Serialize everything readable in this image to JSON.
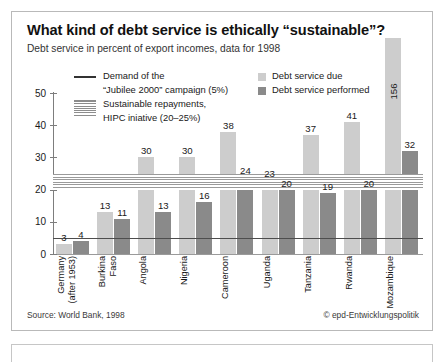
{
  "header": {
    "title": "What kind of debt service is ethically “sustainable”?",
    "subtitle": "Debt service in percent of export incomes, data for 1998"
  },
  "legend": {
    "jubilee_line_1": "Demand of the",
    "jubilee_line_2": "“Jubilee 2000” campaign (5%)",
    "hipc_line_1": "Sustainable repayments,",
    "hipc_line_2": "HIPC iniative (20–25%)",
    "due_label": "Debt service due",
    "performed_label": "Debt service performed"
  },
  "footer": {
    "source": "Source: World Bank, 1998",
    "credit": "© epd-Entwicklungspolitik"
  },
  "colors": {
    "due": "#cdcdcd",
    "performed": "#8a8a8a",
    "axis": "#7d7d7d",
    "jubilee_line": "#4d4d4d",
    "hipc_band": "#9a9a9a"
  },
  "chart_data": {
    "type": "bar",
    "title": "What kind of debt service is ethically “sustainable”?",
    "subtitle": "Debt service in percent of export incomes, data for 1998",
    "xlabel": "",
    "ylabel": "",
    "ylim": [
      0,
      50
    ],
    "yticks": [
      0,
      10,
      20,
      30,
      40,
      50
    ],
    "ytick_labels": [
      "0",
      "10",
      "20",
      "30",
      "40",
      "50"
    ],
    "grid": false,
    "legend_position": "top",
    "categories": [
      "Germany\n(after 1953)",
      "Burkina\nFaso",
      "Angola",
      "Nigeria",
      "Cameroon",
      "Uganda",
      "Tanzania",
      "Rwanda",
      "Mozambique"
    ],
    "series": [
      {
        "name": "Debt service due",
        "color": "#cdcdcd",
        "values": [
          3,
          13,
          30,
          30,
          38,
          23,
          37,
          41,
          156
        ]
      },
      {
        "name": "Debt service performed",
        "color": "#8a8a8a",
        "values": [
          4,
          11,
          13,
          16,
          24,
          20,
          19,
          20,
          32
        ]
      }
    ],
    "reference_lines": [
      {
        "name": "Jubilee 2000 demand",
        "value": 5,
        "label": "Demand of the “Jubilee 2000” campaign (5%)",
        "style": "solid"
      }
    ],
    "reference_bands": [
      {
        "name": "HIPC initiative",
        "from": 20,
        "to": 25,
        "label": "Sustainable repayments, HIPC iniative (20–25%)",
        "style": "hatched"
      }
    ]
  }
}
